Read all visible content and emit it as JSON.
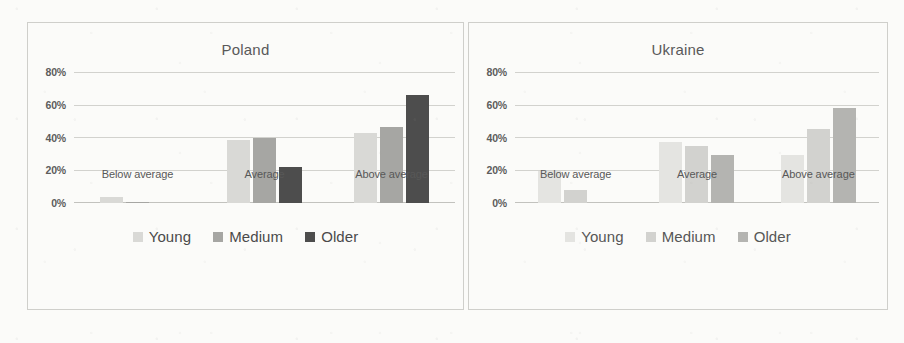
{
  "chart_data": [
    {
      "type": "bar",
      "title": "Poland",
      "xlabel": "",
      "ylabel": "",
      "ylim": [
        0,
        90
      ],
      "grid": true,
      "legend_position": "bottom",
      "categories": [
        "Below average",
        "Average",
        "Above average"
      ],
      "ticks": [
        "0%",
        "20%",
        "40%",
        "60%",
        "80%"
      ],
      "tick_values": [
        0,
        20,
        40,
        60,
        80
      ],
      "series": [
        {
          "name": "Young",
          "color": "#d9d9d6",
          "values": [
            4,
            43,
            48
          ]
        },
        {
          "name": "Medium",
          "color": "#a6a6a3",
          "values": [
            1,
            45,
            52
          ]
        },
        {
          "name": "Older",
          "color": "#4d4d4d",
          "values": [
            0,
            25,
            74
          ]
        }
      ]
    },
    {
      "type": "bar",
      "title": "Ukraine",
      "xlabel": "",
      "ylabel": "",
      "ylim": [
        0,
        90
      ],
      "grid": true,
      "legend_position": "bottom",
      "categories": [
        "Below average",
        "Average",
        "Above average"
      ],
      "ticks": [
        "0%",
        "20%",
        "40%",
        "60%",
        "80%"
      ],
      "tick_values": [
        0,
        20,
        40,
        60,
        80
      ],
      "series": [
        {
          "name": "Young",
          "color": "#e4e4e1",
          "values": [
            22,
            42,
            33
          ]
        },
        {
          "name": "Medium",
          "color": "#d2d2cf",
          "values": [
            9,
            39,
            51
          ]
        },
        {
          "name": "Older",
          "color": "#b4b4b1",
          "values": [
            0,
            33,
            65
          ]
        }
      ]
    }
  ]
}
